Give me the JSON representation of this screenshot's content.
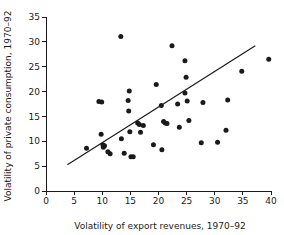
{
  "chart_data": {
    "type": "scatter",
    "title": "",
    "xlabel": "Volatility of export revenues, 1970–92",
    "ylabel": "Volatility of private consumption, 1970–92",
    "xlim": [
      0,
      40
    ],
    "ylim": [
      0,
      35
    ],
    "xticks": [
      0,
      5,
      10,
      15,
      20,
      25,
      30,
      35,
      40
    ],
    "yticks": [
      0,
      5,
      10,
      15,
      20,
      25,
      30,
      35
    ],
    "xtick_labels": [
      "0",
      "5",
      "10",
      "15",
      "20",
      "25",
      "30",
      "35",
      "40"
    ],
    "ytick_labels": [
      "0",
      "5",
      "10",
      "15",
      "20",
      "25",
      "30",
      "35"
    ],
    "grid": false,
    "legend": null,
    "marker_color": "#1a1a1a",
    "line_color": "#1a1a1a",
    "points": [
      [
        7.2,
        8.6
      ],
      [
        9.4,
        18.0
      ],
      [
        9.9,
        17.9
      ],
      [
        9.8,
        11.4
      ],
      [
        10.1,
        9.3
      ],
      [
        10.2,
        8.8
      ],
      [
        10.4,
        9.1
      ],
      [
        11.0,
        7.9
      ],
      [
        11.4,
        7.5
      ],
      [
        13.3,
        31.1
      ],
      [
        13.4,
        10.5
      ],
      [
        13.9,
        7.6
      ],
      [
        14.8,
        20.1
      ],
      [
        14.6,
        18.2
      ],
      [
        14.7,
        16.1
      ],
      [
        14.9,
        11.9
      ],
      [
        15.1,
        6.9
      ],
      [
        15.5,
        6.9
      ],
      [
        16.3,
        13.7
      ],
      [
        16.6,
        13.4
      ],
      [
        16.8,
        11.8
      ],
      [
        17.3,
        13.2
      ],
      [
        19.1,
        9.3
      ],
      [
        19.6,
        21.4
      ],
      [
        20.5,
        17.2
      ],
      [
        20.6,
        8.3
      ],
      [
        20.9,
        14.0
      ],
      [
        21.2,
        13.7
      ],
      [
        21.5,
        13.6
      ],
      [
        22.4,
        29.2
      ],
      [
        23.4,
        17.5
      ],
      [
        23.7,
        12.8
      ],
      [
        24.7,
        26.2
      ],
      [
        24.7,
        19.7
      ],
      [
        24.9,
        22.9
      ],
      [
        25.1,
        18.1
      ],
      [
        25.4,
        14.2
      ],
      [
        27.6,
        9.7
      ],
      [
        27.9,
        17.8
      ],
      [
        30.5,
        9.8
      ],
      [
        32.0,
        12.2
      ],
      [
        32.3,
        18.3
      ],
      [
        34.8,
        24.1
      ],
      [
        39.6,
        26.5
      ]
    ],
    "trend_line": {
      "x0": 3.8,
      "y0": 5.3,
      "x1": 37.2,
      "y1": 29.2
    }
  }
}
